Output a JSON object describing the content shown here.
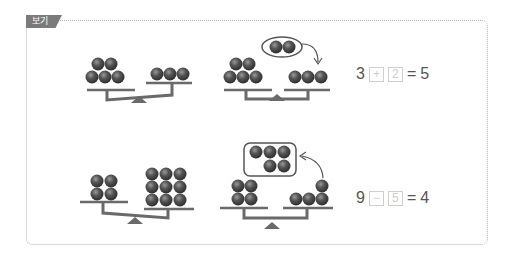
{
  "tag": {
    "label": "보기"
  },
  "examples": [
    {
      "name": "addition",
      "left_pan_balls": 5,
      "right_pan_balls": 3,
      "moved_balls": 2,
      "equation": {
        "a": "3",
        "op": "+",
        "b": "2",
        "eq": "=",
        "result": "5"
      }
    },
    {
      "name": "subtraction",
      "left_pan_balls": 4,
      "right_pan_balls": 9,
      "moved_balls": 5,
      "equation": {
        "a": "9",
        "op": "−",
        "b": "5",
        "eq": "=",
        "result": "4"
      }
    }
  ],
  "colors": {
    "tag_bg": "#7b7b7b",
    "ball": "#4a4a4a",
    "scale": "#6a6a6a",
    "box_border": "#cfcfcf"
  }
}
